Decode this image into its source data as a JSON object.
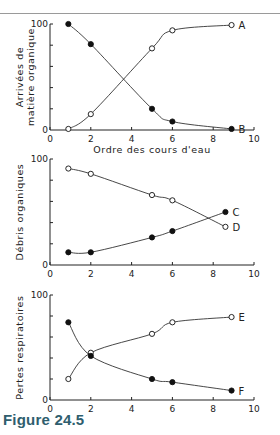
{
  "figure": {
    "caption": "Figure 24.5"
  },
  "chart_data": [
    {
      "type": "line",
      "title": "",
      "xlabel": "Ordre des cours d'eau",
      "ylabel": "Arrivées de matière organique",
      "xlim": [
        0,
        10
      ],
      "ylim": [
        0,
        100
      ],
      "xticks": [
        0,
        2,
        4,
        6,
        8,
        10
      ],
      "yticks_labeled": [
        0,
        100
      ],
      "series": [
        {
          "name": "A",
          "marker": "open",
          "x": [
            0.9,
            2,
            5,
            6,
            8.9
          ],
          "y": [
            1,
            15,
            77,
            94,
            99
          ]
        },
        {
          "name": "B",
          "marker": "filled",
          "x": [
            0.9,
            2,
            5,
            6,
            8.9
          ],
          "y": [
            100,
            81,
            20,
            8,
            1
          ]
        }
      ]
    },
    {
      "type": "line",
      "title": "",
      "xlabel": "",
      "ylabel": "Débris organiques",
      "xlim": [
        0,
        10
      ],
      "ylim": [
        0,
        100
      ],
      "xticks": [
        0,
        2,
        4,
        6,
        8,
        10
      ],
      "yticks_labeled": [
        0,
        100
      ],
      "series": [
        {
          "name": "C",
          "marker": "filled",
          "x": [
            0.9,
            2,
            5,
            6,
            8.6
          ],
          "y": [
            12,
            12,
            26,
            32,
            50
          ]
        },
        {
          "name": "D",
          "marker": "open",
          "x": [
            0.9,
            2,
            5,
            6,
            8.6
          ],
          "y": [
            91,
            86,
            66,
            61,
            36
          ]
        }
      ]
    },
    {
      "type": "line",
      "title": "",
      "xlabel": "",
      "ylabel": "Pertes respiratoires",
      "xlim": [
        0,
        10
      ],
      "ylim": [
        0,
        100
      ],
      "xticks": [
        0,
        2,
        4,
        6,
        8,
        10
      ],
      "yticks_labeled": [
        0,
        100
      ],
      "series": [
        {
          "name": "E",
          "marker": "open",
          "x": [
            0.9,
            2,
            5,
            6,
            8.9
          ],
          "y": [
            20,
            45,
            63,
            74,
            79
          ]
        },
        {
          "name": "F",
          "marker": "filled",
          "x": [
            0.9,
            2,
            5,
            6,
            8.9
          ],
          "y": [
            74,
            42,
            20,
            17,
            9
          ]
        }
      ]
    }
  ]
}
